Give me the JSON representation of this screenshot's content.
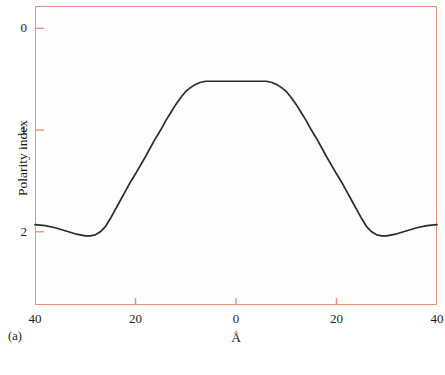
{
  "figure": {
    "panel_label": "(a)",
    "frame_color": "#e89079",
    "curve_color": "#2b2b2b",
    "background_color": "#fffefd"
  },
  "axes": {
    "y_title": "Polarity index",
    "x_title": "Å",
    "y_ticks": [
      {
        "label": "0",
        "value": 0
      },
      {
        "label": "1",
        "value": 1
      },
      {
        "label": "2",
        "value": 2
      }
    ],
    "x_ticks": [
      {
        "label": "40",
        "value": -40
      },
      {
        "label": "20",
        "value": -20
      },
      {
        "label": "0",
        "value": 0
      },
      {
        "label": "20",
        "value": 20
      },
      {
        "label": "40",
        "value": 40
      }
    ]
  },
  "chart_data": {
    "type": "line",
    "title": "",
    "subtitle": "",
    "xlabel": "Å",
    "ylabel": "Polarity index",
    "xlim": [
      -40,
      40
    ],
    "ylim": [
      2.72,
      -0.22
    ],
    "y_axis_inverted": true,
    "grid": false,
    "legend": null,
    "annotations": [
      "(a)"
    ],
    "series": [
      {
        "name": "Polarity index profile",
        "x": [
          -40,
          -38,
          -36,
          -34,
          -32,
          -30,
          -29,
          -28,
          -27,
          -26,
          -25,
          -24,
          -23,
          -22,
          -21,
          -20,
          -18,
          -16,
          -15,
          -14,
          -13,
          -12,
          -11,
          -10,
          -9,
          -8,
          -7,
          -6,
          -5,
          -4,
          -2,
          0,
          2,
          4,
          5,
          6,
          7,
          8,
          9,
          10,
          11,
          12,
          13,
          14,
          15,
          16,
          18,
          20,
          21,
          22,
          23,
          24,
          25,
          26,
          27,
          28,
          29,
          30,
          32,
          34,
          36,
          38,
          40
        ],
        "y": [
          1.93,
          1.94,
          1.96,
          1.99,
          2.02,
          2.04,
          2.04,
          2.03,
          2.0,
          1.95,
          1.87,
          1.78,
          1.69,
          1.6,
          1.51,
          1.43,
          1.26,
          1.08,
          1.0,
          0.91,
          0.83,
          0.75,
          0.68,
          0.62,
          0.58,
          0.55,
          0.53,
          0.52,
          0.52,
          0.52,
          0.52,
          0.52,
          0.52,
          0.52,
          0.52,
          0.52,
          0.53,
          0.55,
          0.58,
          0.62,
          0.68,
          0.75,
          0.83,
          0.91,
          1.0,
          1.08,
          1.26,
          1.43,
          1.51,
          1.6,
          1.69,
          1.78,
          1.87,
          1.95,
          2.0,
          2.03,
          2.04,
          2.04,
          2.02,
          1.99,
          1.96,
          1.94,
          1.93
        ]
      }
    ]
  }
}
